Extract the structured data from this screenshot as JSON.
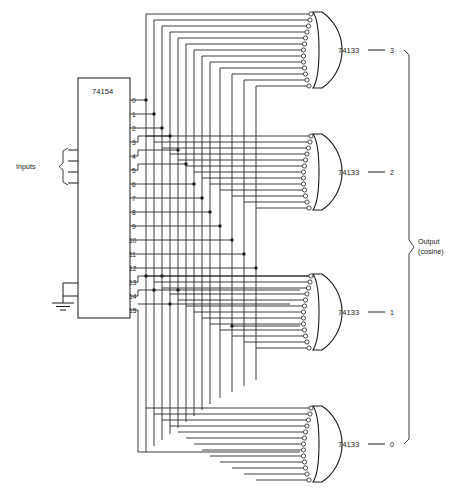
{
  "diagram": {
    "background": "#ffffff",
    "line_color": "#1a1a1a"
  },
  "decoder": {
    "name": "decoder-74154",
    "part_number": "74154",
    "output_pins": [
      "0",
      "1",
      "2",
      "3",
      "4",
      "5",
      "6",
      "7",
      "8",
      "9",
      "10",
      "11",
      "12",
      "13",
      "14",
      "15"
    ],
    "address_inputs": [
      "A",
      "B",
      "C",
      "D"
    ],
    "enable_inputs": [
      "G",
      "G"
    ],
    "enable_labels": [
      "G",
      "G"
    ],
    "enable_subscripts": [
      "1",
      "2"
    ],
    "inputs_label": "Inputs",
    "ground_label": ""
  },
  "gates": [
    {
      "name": "nand-gate-bit3",
      "part_number": "74133",
      "output_label": "3",
      "input_count": 13
    },
    {
      "name": "nand-gate-bit2",
      "part_number": "74133",
      "output_label": "2",
      "input_count": 13
    },
    {
      "name": "nand-gate-bit1",
      "part_number": "74133",
      "output_label": "1",
      "input_count": 13
    },
    {
      "name": "nand-gate-bit0",
      "part_number": "74133",
      "output_label": "0",
      "input_count": 13
    }
  ],
  "output_bus": {
    "label_line1": "Output",
    "label_line2": "(cosine)"
  }
}
